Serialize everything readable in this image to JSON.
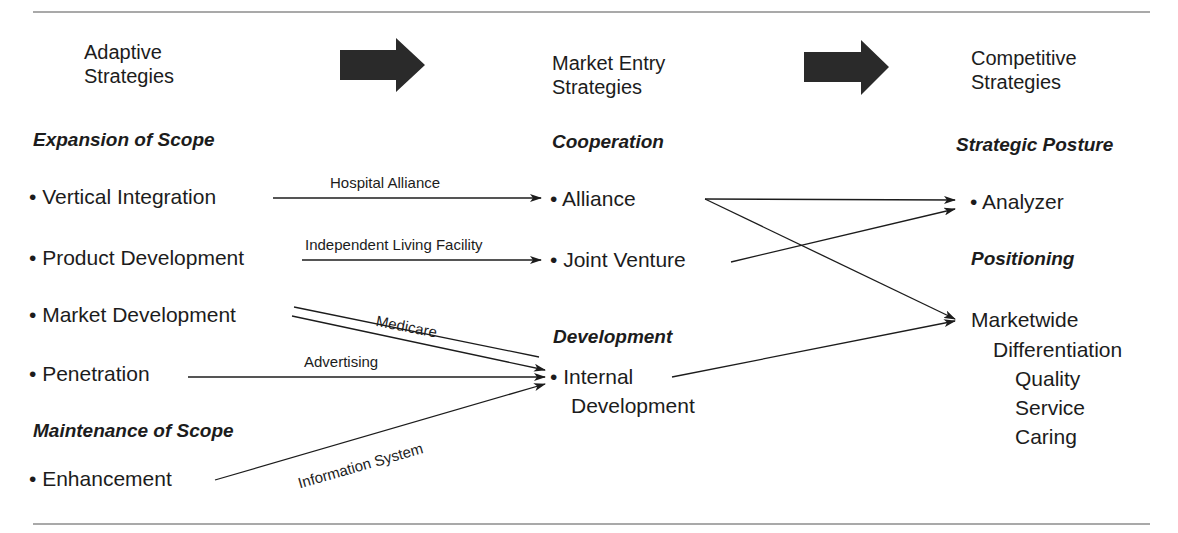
{
  "columns": [
    {
      "title_line1": "Adaptive",
      "title_line2": "Strategies"
    },
    {
      "title_line1": "Market Entry",
      "title_line2": "Strategies"
    },
    {
      "title_line1": "Competitive",
      "title_line2": "Strategies"
    }
  ],
  "adaptive": {
    "expansion_heading": "Expansion of Scope",
    "maintenance_heading": "Maintenance of Scope",
    "items": [
      "• Vertical Integration",
      "• Product Development",
      "• Market Development",
      "• Penetration",
      "• Enhancement"
    ]
  },
  "market_entry": {
    "cooperation_heading": "Cooperation",
    "development_heading": "Development",
    "items": [
      "• Alliance",
      "• Joint Venture",
      "• Internal",
      "Development"
    ]
  },
  "competitive": {
    "posture_heading": "Strategic Posture",
    "positioning_heading": "Positioning",
    "posture_item": "• Analyzer",
    "positioning_items": [
      "Marketwide",
      "Differentiation",
      "Quality",
      "Service",
      "Caring"
    ]
  },
  "edge_labels": {
    "hospital_alliance": "Hospital Alliance",
    "independent_living": "Independent Living Facility",
    "medicare": "Medicare",
    "advertising": "Advertising",
    "information_system": "Information System"
  },
  "colors": {
    "ink": "#1c1c1c",
    "block_arrow": "#2a2a2a",
    "rule": "#555555"
  }
}
